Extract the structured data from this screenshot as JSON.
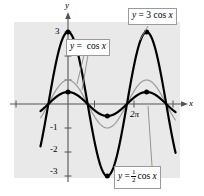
{
  "figure": {
    "background_color": "#ffffff",
    "plot_background_color": "#e9e9e9",
    "axis_color": "#555555",
    "curve_colors": {
      "thick_black": "#000000",
      "thin_gray": "#9a9a9a"
    }
  },
  "axes": {
    "x_label": "x",
    "y_label": "y",
    "y_ticks": [
      "3",
      "-1",
      "-2",
      "-3"
    ],
    "x_ticks": [
      "2π"
    ]
  },
  "callouts": {
    "three_cos": {
      "lhs": "y",
      "eq": "=",
      "coef": "3",
      "fn": "cos",
      "var": "x"
    },
    "cos": {
      "lhs": "y",
      "eq": "=",
      "fn": "cos",
      "var": "x"
    },
    "half_cos": {
      "lhs": "y",
      "eq": "=",
      "num": "1",
      "den": "2",
      "fn": "cos",
      "var": "x"
    }
  },
  "chart_data": {
    "type": "line",
    "title": "",
    "xlabel": "x",
    "ylabel": "y",
    "xlim": [
      -2.2,
      8.6
    ],
    "ylim": [
      -3.6,
      3.6
    ],
    "grid": false,
    "legend": "annotations",
    "x_tick_values": [
      6.283185307179586
    ],
    "x_tick_labels": [
      "2π"
    ],
    "y_tick_values": [
      3,
      -1,
      -2,
      -3
    ],
    "y_tick_labels": [
      "3",
      "-1",
      "-2",
      "-3"
    ],
    "series": [
      {
        "name": "y = 3 cos x",
        "expression": "3*cos(x)",
        "amplitude": 3,
        "period": 6.283185307179586,
        "color": "#000000",
        "linewidth": 2.2,
        "markers": [
          {
            "x": 0,
            "y": 3
          },
          {
            "x": 3.141592653589793,
            "y": -3
          },
          {
            "x": 6.283185307179586,
            "y": 3
          }
        ]
      },
      {
        "name": "y = cos x",
        "expression": "cos(x)",
        "amplitude": 1,
        "period": 6.283185307179586,
        "color": "#9a9a9a",
        "linewidth": 1.2,
        "markers": []
      },
      {
        "name": "y = 1/2 cos x",
        "expression": "0.5*cos(x)",
        "amplitude": 0.5,
        "period": 6.283185307179586,
        "color": "#000000",
        "linewidth": 2.2,
        "markers": [
          {
            "x": 0,
            "y": 0.5
          },
          {
            "x": 3.141592653589793,
            "y": -0.5
          },
          {
            "x": 6.283185307179586,
            "y": 0.5
          }
        ]
      }
    ],
    "annotations": [
      {
        "text": "y = 3 cos x",
        "points_to": {
          "x": 6.283185307179586,
          "y": 3
        }
      },
      {
        "text": "y = cos x",
        "points_to": {
          "x": 1.05,
          "y": 0.5
        }
      },
      {
        "text": "y = 1/2 cos x",
        "points_to": {
          "x": 6.5,
          "y": -0.1
        }
      }
    ]
  }
}
